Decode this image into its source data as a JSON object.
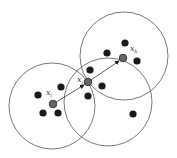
{
  "diagram": {
    "circles": [
      {
        "id": "circle-i",
        "cx": 52,
        "cy": 106,
        "r": 43
      },
      {
        "id": "circle-j",
        "cx": 108,
        "cy": 102,
        "r": 44
      },
      {
        "id": "circle-k",
        "cx": 124,
        "cy": 56,
        "r": 44
      }
    ],
    "centers": [
      {
        "id": "xi",
        "cx": 53,
        "cy": 104,
        "label": "x",
        "sub": "i",
        "lx": 46,
        "ly": 95
      },
      {
        "id": "xj",
        "cx": 88,
        "cy": 82,
        "label": "x",
        "sub": "j",
        "lx": 77,
        "ly": 82
      },
      {
        "id": "xk",
        "cx": 123,
        "cy": 58,
        "label": "x",
        "sub": "k",
        "lx": 130,
        "ly": 51
      }
    ],
    "points": [
      [
        38,
        95
      ],
      [
        61,
        87
      ],
      [
        43,
        113
      ],
      [
        58,
        113
      ],
      [
        90,
        70
      ],
      [
        102,
        86
      ],
      [
        88,
        96
      ],
      [
        107,
        53
      ],
      [
        125,
        43
      ],
      [
        137,
        61
      ],
      [
        133,
        114
      ]
    ],
    "arrows": [
      {
        "from": [
          53,
          104
        ],
        "to": [
          84,
          85
        ]
      },
      {
        "from": [
          88,
          82
        ],
        "to": [
          119,
          61
        ]
      }
    ],
    "colors": {
      "stroke": "#555555",
      "point": "#1a1a1a",
      "center": "#666666"
    }
  }
}
